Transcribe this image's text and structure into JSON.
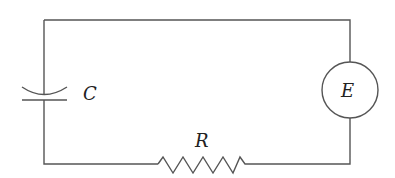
{
  "diagram": {
    "type": "series RC circuit",
    "components": [
      {
        "id": "capacitor",
        "label": "C"
      },
      {
        "id": "resistor",
        "label": "R"
      },
      {
        "id": "emf-source",
        "label": "E"
      }
    ],
    "colors": {
      "wire": "#555555",
      "label": "#222222",
      "background": "#ffffff"
    }
  }
}
